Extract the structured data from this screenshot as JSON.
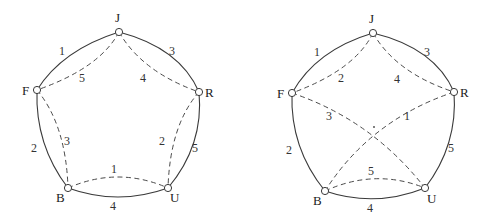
{
  "figure": {
    "diagrams": [
      {
        "id": "left",
        "vertices": [
          {
            "name": "J",
            "x": 119,
            "y": 32,
            "lx": 115,
            "ly": 22
          },
          {
            "name": "F",
            "x": 37,
            "y": 90,
            "lx": 22,
            "ly": 95
          },
          {
            "name": "R",
            "x": 199,
            "y": 92,
            "lx": 205,
            "ly": 97
          },
          {
            "name": "B",
            "x": 68,
            "y": 188,
            "lx": 56,
            "ly": 202
          },
          {
            "name": "U",
            "x": 168,
            "y": 188,
            "lx": 170,
            "ly": 202
          }
        ],
        "edges": [
          {
            "from": "J",
            "to": "F",
            "style": "solid",
            "label": "1",
            "path": "M119,32 Q62,50 37,90",
            "lx": 62,
            "ly": 55
          },
          {
            "from": "J",
            "to": "R",
            "style": "solid",
            "label": "3",
            "path": "M119,32 Q180,48 199,92",
            "lx": 172,
            "ly": 55
          },
          {
            "from": "F",
            "to": "B",
            "style": "solid",
            "label": "2",
            "path": "M37,90 Q35,145 68,188",
            "lx": 34,
            "ly": 152
          },
          {
            "from": "R",
            "to": "U",
            "style": "solid",
            "label": "5",
            "path": "M199,92 Q204,145 168,188",
            "lx": 195,
            "ly": 152
          },
          {
            "from": "B",
            "to": "U",
            "style": "solid",
            "label": "4",
            "path": "M68,188 Q118,206 168,188",
            "lx": 113,
            "ly": 210
          },
          {
            "from": "J",
            "to": "F",
            "style": "dashed",
            "label": "5",
            "path": "M119,32 Q100,68 37,90",
            "lx": 82,
            "ly": 82
          },
          {
            "from": "J",
            "to": "R",
            "style": "dashed",
            "label": "4",
            "path": "M119,32 Q142,72 199,92",
            "lx": 143,
            "ly": 82
          },
          {
            "from": "F",
            "to": "B",
            "style": "dashed",
            "label": "3",
            "path": "M37,90 Q66,125 68,188",
            "lx": 67,
            "ly": 145
          },
          {
            "from": "R",
            "to": "U",
            "style": "dashed",
            "label": "2",
            "path": "M199,92 Q170,125 168,188",
            "lx": 162,
            "ly": 145
          },
          {
            "from": "B",
            "to": "U",
            "style": "dashed",
            "label": "1",
            "path": "M68,188 Q118,166 168,188",
            "lx": 114,
            "ly": 173
          }
        ]
      },
      {
        "id": "right",
        "vertices": [
          {
            "name": "J",
            "x": 373,
            "y": 33,
            "lx": 369,
            "ly": 23
          },
          {
            "name": "F",
            "x": 292,
            "y": 93,
            "lx": 277,
            "ly": 98
          },
          {
            "name": "R",
            "x": 454,
            "y": 92,
            "lx": 460,
            "ly": 97
          },
          {
            "name": "B",
            "x": 325,
            "y": 191,
            "lx": 313,
            "ly": 205
          },
          {
            "name": "U",
            "x": 425,
            "y": 188,
            "lx": 427,
            "ly": 203
          }
        ],
        "edges": [
          {
            "from": "J",
            "to": "F",
            "style": "solid",
            "label": "1",
            "path": "M373,33 Q316,50 292,93",
            "lx": 317,
            "ly": 56
          },
          {
            "from": "J",
            "to": "R",
            "style": "solid",
            "label": "3",
            "path": "M373,33 Q435,48 454,92",
            "lx": 427,
            "ly": 56
          },
          {
            "from": "F",
            "to": "B",
            "style": "solid",
            "label": "2",
            "path": "M292,93 Q290,148 325,191",
            "lx": 289,
            "ly": 154
          },
          {
            "from": "R",
            "to": "U",
            "style": "solid",
            "label": "5",
            "path": "M454,92 Q458,145 425,188",
            "lx": 451,
            "ly": 152
          },
          {
            "from": "B",
            "to": "U",
            "style": "solid",
            "label": "4",
            "path": "M325,191 Q375,208 425,188",
            "lx": 370,
            "ly": 212
          },
          {
            "from": "J",
            "to": "F",
            "style": "dashed",
            "label": "2",
            "path": "M373,33 Q355,70 292,93",
            "lx": 341,
            "ly": 82
          },
          {
            "from": "J",
            "to": "R",
            "style": "dashed",
            "label": "4",
            "path": "M373,33 Q396,73 454,92",
            "lx": 397,
            "ly": 83
          },
          {
            "from": "F",
            "to": "U",
            "style": "dashed",
            "label": "3",
            "path": "M292,93 Q372,120 425,188",
            "lx": 329,
            "ly": 120
          },
          {
            "from": "R",
            "to": "B",
            "style": "dashed",
            "label": "1",
            "path": "M454,92 Q370,120 325,191",
            "lx": 407,
            "ly": 120
          },
          {
            "from": "B",
            "to": "U",
            "style": "dashed",
            "label": "5",
            "path": "M325,191 Q375,168 425,188",
            "lx": 371,
            "ly": 175
          }
        ],
        "crossing": {
          "x": 374,
          "y": 127
        }
      }
    ]
  }
}
